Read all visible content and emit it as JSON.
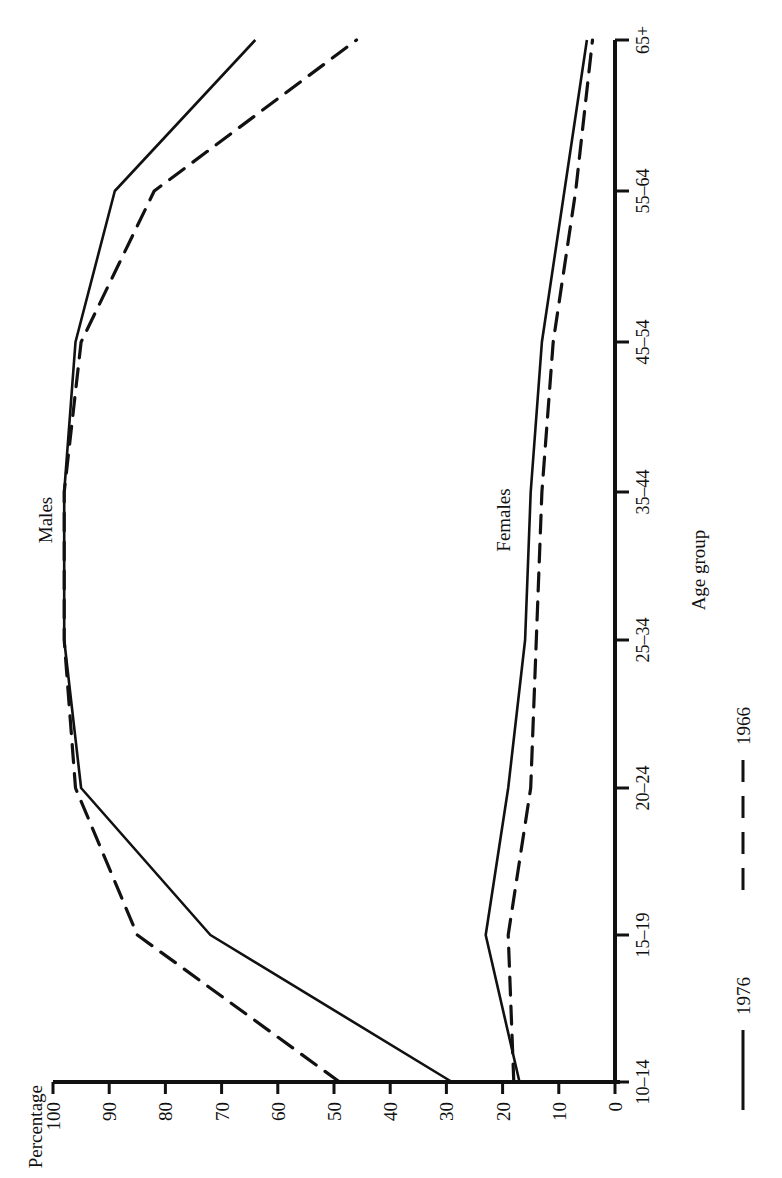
{
  "chart_data": {
    "type": "line",
    "orientation": "rotated-90-ccw",
    "title": "",
    "xlabel": "Age group",
    "ylabel": "Percentage",
    "ylim": [
      0,
      100
    ],
    "yticks": [
      0,
      10,
      20,
      30,
      40,
      50,
      60,
      70,
      80,
      90,
      100
    ],
    "grid": false,
    "categories": [
      "10–14",
      "15–19",
      "20–24",
      "25–34",
      "35–44",
      "45–54",
      "55–64",
      "65+"
    ],
    "groups": [
      {
        "name": "Males",
        "series": [
          {
            "name": "1976",
            "style": "solid",
            "values": [
              29,
              72,
              95,
              98,
              98,
              96,
              89,
              64
            ]
          },
          {
            "name": "1966",
            "style": "dashed",
            "values": [
              49,
              85,
              96,
              98,
              98,
              95,
              82,
              46
            ]
          }
        ]
      },
      {
        "name": "Females",
        "series": [
          {
            "name": "1976",
            "style": "solid",
            "values": [
              17,
              23,
              19,
              16,
              15,
              13,
              9,
              5
            ]
          },
          {
            "name": "1966",
            "style": "dashed",
            "values": [
              18,
              19,
              15,
              14,
              13,
              11,
              7,
              4
            ]
          }
        ]
      }
    ],
    "legend": [
      {
        "label": "1976",
        "style": "solid"
      },
      {
        "label": "1966",
        "style": "dashed"
      }
    ],
    "legend_position": "bottom"
  },
  "labels": {
    "y_axis_title": "Percentage",
    "x_axis_title": "Age group",
    "males": "Males",
    "females": "Females",
    "legend_1976": "1976",
    "legend_1966": "1966"
  },
  "colors": {
    "ink": "#111111",
    "background": "#ffffff"
  }
}
